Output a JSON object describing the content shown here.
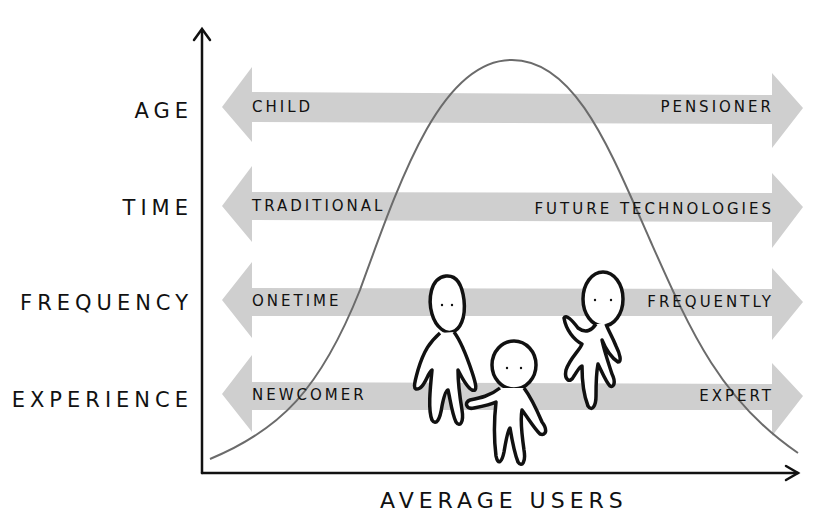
{
  "diagram": {
    "x_axis_label": "AVERAGE USERS",
    "rows": [
      {
        "dimension": "AGE",
        "left": "CHILD",
        "right": "PENSIONER"
      },
      {
        "dimension": "TIME",
        "left": "TRADITIONAL",
        "right": "FUTURE TECHNOLOGIES"
      },
      {
        "dimension": "FREQUENCY",
        "left": "ONETIME",
        "right": "FREQUENTLY"
      },
      {
        "dimension": "EXPERIENCE",
        "left": "NEWCOMER",
        "right": "EXPERT"
      }
    ],
    "curve": "bell-curve",
    "figures": [
      "tall-person",
      "small-person-waving",
      "person-waving"
    ],
    "colors": {
      "arrow_fill": "#cfcfcf",
      "curve": "#6b6b6b",
      "ink": "#111111",
      "background": "#ffffff"
    }
  }
}
